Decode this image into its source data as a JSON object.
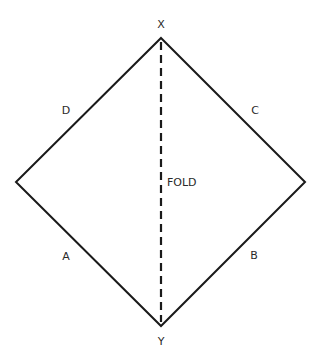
{
  "diagram": {
    "type": "folding-diagram",
    "shape": "square rotated 45 degrees (diamond)",
    "colors": {
      "line": "#1a1a1a",
      "text": "#2a2a2a",
      "background": "#ffffff"
    },
    "vertices": {
      "top": {
        "label": "X"
      },
      "bottom": {
        "label": "Y"
      }
    },
    "edges": {
      "upper_left": {
        "label": "D"
      },
      "upper_right": {
        "label": "C"
      },
      "lower_left": {
        "label": "A"
      },
      "lower_right": {
        "label": "B"
      }
    },
    "fold_line": {
      "label": "FOLD",
      "style": "dashed",
      "from": "X",
      "to": "Y"
    }
  }
}
